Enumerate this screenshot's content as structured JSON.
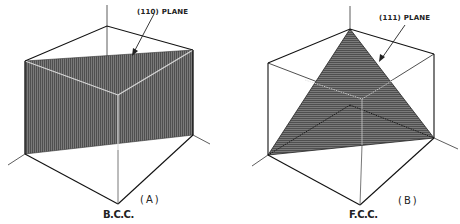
{
  "figure": {
    "panels": [
      {
        "id": "A",
        "panel_label": "(A)",
        "structure_label": "B.C.C.",
        "plane_label": "(110) PLANE",
        "plane_shape": "rectangle (diagonal plane)"
      },
      {
        "id": "B",
        "panel_label": "(B)",
        "structure_label": "F.C.C.",
        "plane_label": "(111) PLANE",
        "plane_shape": "triangle"
      }
    ],
    "colors": {
      "line": "#1a1a1a",
      "plane_fill": "#6e6e6e",
      "hatch": "#4a4a4a",
      "background": "#ffffff"
    }
  }
}
